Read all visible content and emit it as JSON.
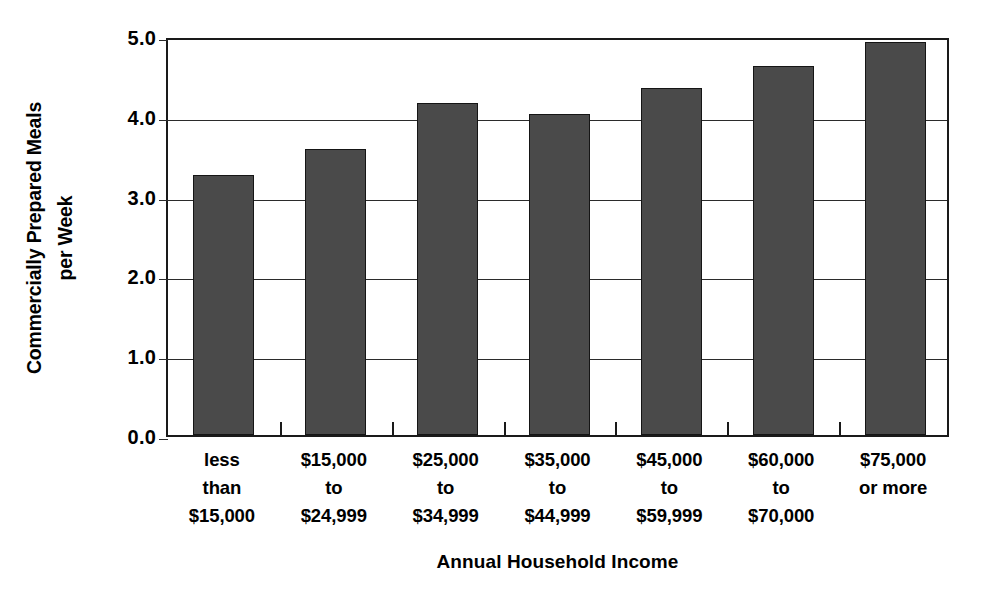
{
  "chart_data": {
    "type": "bar",
    "title": "",
    "subtitle": "",
    "xlabel": "Annual Household Income",
    "ylabel": "Commercially Prepared Meals per Week",
    "ylabel_lines": [
      "Commercially Prepared Meals",
      "per Week"
    ],
    "categories": [
      "less than $15,000",
      "$15,000 to $24,999",
      "$25,000 to $34,999",
      "$35,000 to $44,999",
      "$45,000 to $59,999",
      "$60,000 to $70,000",
      "$75,000 or more"
    ],
    "category_label_lines": [
      [
        "less",
        "than",
        "$15,000"
      ],
      [
        "$15,000",
        "to",
        "$24,999"
      ],
      [
        "$25,000",
        "to",
        "$34,999"
      ],
      [
        "$35,000",
        "to",
        "$44,999"
      ],
      [
        "$45,000",
        "to",
        "$59,999"
      ],
      [
        "$60,000",
        "to",
        "$70,000"
      ],
      [
        "$75,000",
        "or more"
      ]
    ],
    "values": [
      3.26,
      3.58,
      4.16,
      4.02,
      4.35,
      4.63,
      4.92
    ],
    "ylim": [
      0.0,
      5.0
    ],
    "ytick_labels": [
      "0.0",
      "1.0",
      "2.0",
      "3.0",
      "4.0",
      "5.0"
    ],
    "ytick_values": [
      0.0,
      1.0,
      2.0,
      3.0,
      4.0,
      5.0
    ],
    "grid": "horizontal",
    "legend": "none",
    "bar_color": "#4a4a4a",
    "bar_edge_color": "#151515",
    "axis_color": "#1a1a1a",
    "background_color": "#ffffff"
  }
}
